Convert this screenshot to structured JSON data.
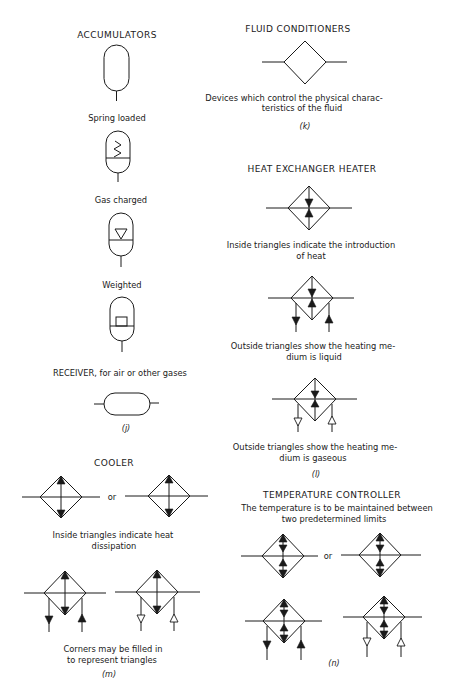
{
  "left_column": {
    "accumulators": {
      "title": "ACCUMULATORS",
      "variants": [
        {
          "label": "Spring loaded",
          "icon": "spring-zigzag"
        },
        {
          "label": "Gas charged",
          "icon": "inverted-open-triangle"
        },
        {
          "label": "Weighted",
          "icon": "weight-block"
        }
      ]
    },
    "receiver": {
      "title": "RECEIVER, for air or other gases",
      "figure_tag": "(j)"
    },
    "cooler": {
      "title": "COOLER",
      "or_label": "or",
      "note_line1": "Inside triangles indicate heat",
      "note_line2": "dissipation",
      "corners_line1": "Corners may be filled in",
      "corners_line2": "to represent triangles",
      "figure_tag": "(m)"
    }
  },
  "right_column": {
    "fluid_conditioners": {
      "title": "FLUID CONDITIONERS",
      "desc_line1": "Devices which control the physical charac-",
      "desc_line2": "teristics of the fluid",
      "figure_tag": "(k)"
    },
    "heat_exchanger_heater": {
      "title": "HEAT EXCHANGER HEATER",
      "inside_line1": "Inside triangles indicate the introduction",
      "inside_line2": "of heat",
      "liquid_line1": "Outside triangles show the heating me-",
      "liquid_line2": "dium is liquid",
      "gas_line1": "Outside triangles show the heating me-",
      "gas_line2": "dium is gaseous",
      "figure_tag": "(l)"
    },
    "temperature_controller": {
      "title": "TEMPERATURE CONTROLLER",
      "desc_line1": "The temperature is to be maintained between",
      "desc_line2": "two predetermined limits",
      "or_label": "or",
      "figure_tag": "(n)"
    }
  },
  "colors": {
    "ink": "#1a1a1a",
    "paper": "#ffffff"
  }
}
